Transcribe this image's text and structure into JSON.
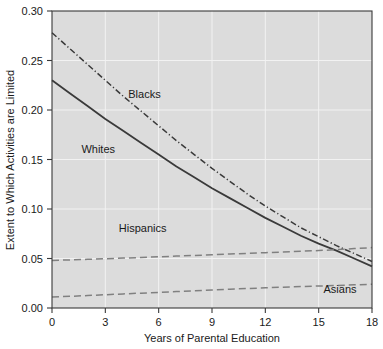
{
  "chart_data": {
    "type": "line",
    "title": "",
    "xlabel": "Years of Parental Education",
    "ylabel": "Extent to Which Activities are Limited",
    "xlim": [
      0,
      18
    ],
    "ylim": [
      0.0,
      0.3
    ],
    "grid": true,
    "legend_position": "inline-annotations",
    "plot_background_color": "#dcdcdc",
    "grid_color": "#f2f2f2",
    "axis_color": "#3a3a3a",
    "xticks": [
      0,
      3,
      6,
      9,
      12,
      15,
      18
    ],
    "xtick_labels": [
      "0",
      "3",
      "6",
      "9",
      "12",
      "15",
      "18"
    ],
    "yticks": [
      0.0,
      0.05,
      0.1,
      0.15,
      0.2,
      0.25,
      0.3
    ],
    "ytick_labels": [
      "0.00",
      "0.05",
      "0.10",
      "0.15",
      "0.20",
      "0.25",
      "0.30"
    ],
    "x": [
      0,
      1,
      2,
      3,
      4,
      5,
      6,
      7,
      8,
      9,
      10,
      11,
      12,
      13,
      14,
      15,
      16,
      17,
      18
    ],
    "series": [
      {
        "name": "Blacks",
        "style": "dash-dot",
        "color": "#3a3a3a",
        "label_x": 5.2,
        "label_y": 0.212,
        "values": [
          0.278,
          0.262,
          0.246,
          0.23,
          0.214,
          0.199,
          0.184,
          0.169,
          0.155,
          0.141,
          0.128,
          0.115,
          0.103,
          0.092,
          0.081,
          0.072,
          0.063,
          0.055,
          0.047
        ]
      },
      {
        "name": "Whites",
        "style": "solid",
        "color": "#3a3a3a",
        "label_x": 2.6,
        "label_y": 0.157,
        "values": [
          0.23,
          0.217,
          0.204,
          0.191,
          0.179,
          0.167,
          0.155,
          0.143,
          0.132,
          0.121,
          0.111,
          0.101,
          0.091,
          0.082,
          0.073,
          0.065,
          0.058,
          0.05,
          0.042
        ]
      },
      {
        "name": "Hispanics",
        "style": "dashed",
        "color": "#808080",
        "label_x": 5.1,
        "label_y": 0.077,
        "values": [
          0.048,
          0.0486,
          0.0492,
          0.0498,
          0.0504,
          0.051,
          0.0517,
          0.0524,
          0.0531,
          0.0538,
          0.0545,
          0.0552,
          0.0559,
          0.0566,
          0.0573,
          0.058,
          0.059,
          0.06,
          0.061
        ]
      },
      {
        "name": "Asians",
        "style": "dashed",
        "color": "#808080",
        "label_x": 16.2,
        "label_y": 0.015,
        "values": [
          0.011,
          0.0118,
          0.0126,
          0.0134,
          0.0142,
          0.015,
          0.0158,
          0.0166,
          0.0174,
          0.0182,
          0.019,
          0.0197,
          0.0204,
          0.021,
          0.0216,
          0.0222,
          0.0228,
          0.0234,
          0.024
        ]
      }
    ]
  }
}
